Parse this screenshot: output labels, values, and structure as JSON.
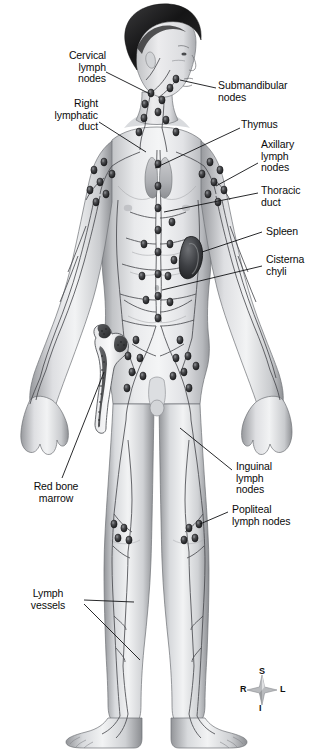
{
  "figure": {
    "background_color": "#ffffff",
    "ink_color": "#0b0b0b"
  },
  "labels": {
    "cervical_lymph_nodes": "Cervical\nlymph\nnodes",
    "right_lymphatic_duct": "Right\nlymphatic\nduct",
    "red_bone_marrow": "Red bone\nmarrow",
    "lymph_vessels": "Lymph\nvessels",
    "submandibular_nodes": "Submandibular\nnodes",
    "thymus": "Thymus",
    "axillary_lymph_nodes": "Axillary\nlymph\nnodes",
    "thoracic_duct": "Thoracic\nduct",
    "spleen": "Spleen",
    "cisterna_chyli": "Cisterna\nchyli",
    "inguinal_lymph_nodes": "Inguinal\nlymph\nnodes",
    "popliteal_lymph_nodes": "Popliteal\nlymph nodes"
  },
  "compass": {
    "superior": "S",
    "inferior": "I",
    "right": "R",
    "left": "L"
  },
  "anatomy": {
    "structures": [
      "cervical lymph nodes",
      "submandibular nodes",
      "right lymphatic duct",
      "thymus",
      "axillary lymph nodes",
      "thoracic duct",
      "spleen",
      "cisterna chyli",
      "red bone marrow",
      "inguinal lymph nodes",
      "popliteal lymph nodes",
      "lymph vessels"
    ]
  }
}
